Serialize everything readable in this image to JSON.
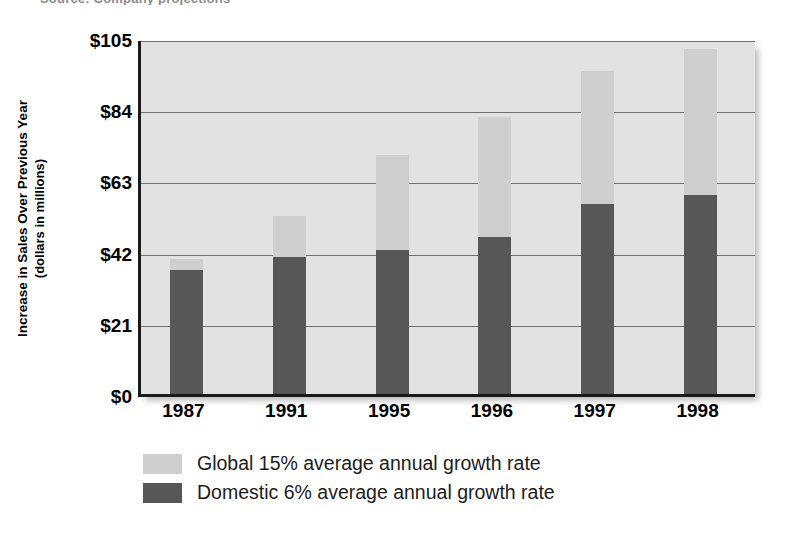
{
  "figure": {
    "clipped_top_text": "Source: Company projections",
    "axis_title_line1": "Increase in Sales Over Previous Year",
    "axis_title_line2": "(dollars in millions)"
  },
  "chart_data": {
    "type": "bar",
    "stacked": true,
    "title": "",
    "xlabel": "",
    "ylabel": "Increase in Sales Over Previous Year (dollars in millions)",
    "categories": [
      "1987",
      "1991",
      "1995",
      "1996",
      "1997",
      "1998"
    ],
    "ytick_labels": [
      "$0",
      "$21",
      "$42",
      "$63",
      "$84",
      "$105"
    ],
    "ytick_values": [
      0,
      21,
      42,
      63,
      84,
      105
    ],
    "ylim": [
      0,
      105
    ],
    "grid": true,
    "legend_position": "below",
    "series": [
      {
        "name": "Domestic 6% average annual growth rate",
        "color": "#575757",
        "values": [
          36.7,
          40.3,
          42.4,
          46.2,
          56.1,
          58.8
        ]
      },
      {
        "name": "Global 15% average annual growth rate",
        "color": "#cfcfcf",
        "values": [
          3.0,
          12.2,
          28.0,
          35.6,
          39.1,
          42.9
        ]
      }
    ],
    "totals": [
      39.7,
      52.5,
      70.4,
      81.8,
      95.2,
      101.7
    ]
  },
  "legend": {
    "items": [
      {
        "label": "Global 15% average annual growth rate",
        "color": "#cfcfcf"
      },
      {
        "label": "Domestic 6% average annual growth rate",
        "color": "#575757"
      }
    ]
  }
}
